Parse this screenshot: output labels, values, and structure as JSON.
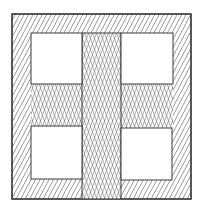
{
  "figure": {
    "colors": {
      "background": "#ffffff",
      "line": "#3a3a3a",
      "hatch": "#4a4a4a"
    },
    "outer_square": {
      "x": 12,
      "y": 14,
      "w": 179,
      "h": 185
    },
    "windows": [
      {
        "name": "top-left-window",
        "x": 31,
        "y": 33,
        "w": 51,
        "h": 51
      },
      {
        "name": "top-right-window",
        "x": 121,
        "y": 33,
        "w": 52,
        "h": 51
      },
      {
        "name": "bottom-left-window",
        "x": 31,
        "y": 126,
        "w": 51,
        "h": 53
      },
      {
        "name": "bottom-right-window",
        "x": 121,
        "y": 128,
        "w": 51,
        "h": 52
      }
    ],
    "cross": {
      "vertical_arm": {
        "x": 82,
        "y": 33,
        "w": 39,
        "h": 166
      },
      "horizontal_arm": {
        "x": 31,
        "y": 84,
        "w": 142,
        "h": 43
      }
    },
    "patterns": {
      "border": "diagonal-hatch",
      "cross": "crosshatch"
    }
  }
}
